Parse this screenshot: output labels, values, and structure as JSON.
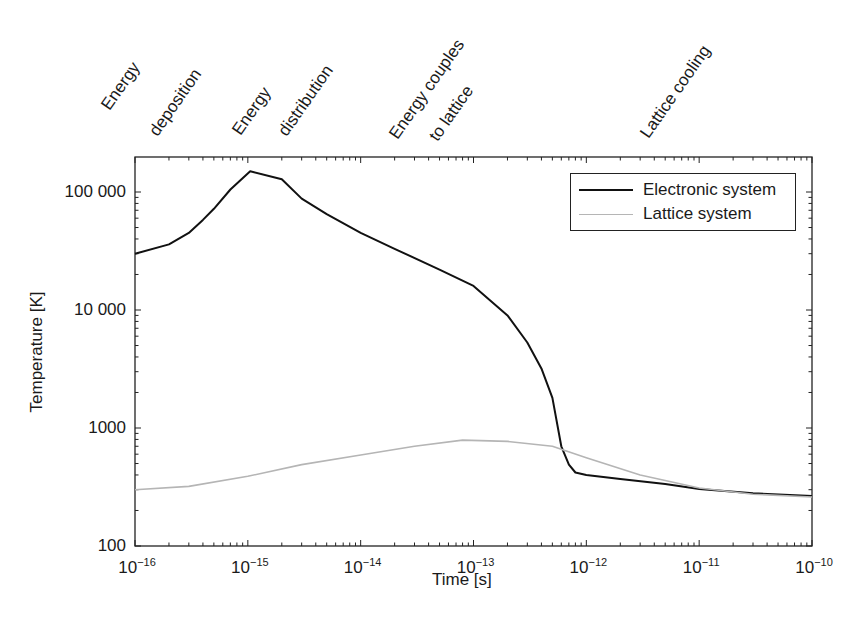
{
  "chart_data": {
    "type": "line",
    "title": "",
    "xlabel": "Time [s]",
    "ylabel": "Temperature [K]",
    "xscale": "log",
    "yscale": "log",
    "xlim": [
      1e-16,
      1e-10
    ],
    "ylim": [
      100,
      200000
    ],
    "x_tick_labels": [
      "10^-16",
      "10^-15",
      "10^-14",
      "10^-13",
      "10^-12",
      "10^-11",
      "10^-10"
    ],
    "y_tick_labels": [
      "100",
      "1000",
      "10 000",
      "100 000"
    ],
    "grid": false,
    "legend_position": "upper right",
    "phase_annotations": [
      {
        "text": "Energy",
        "x": 1e-16
      },
      {
        "text": "deposition",
        "x": 2.2e-16
      },
      {
        "text": "Energy",
        "x": 1e-15
      },
      {
        "text": "distribution",
        "x": 2.2e-15
      },
      {
        "text": "Energy couples",
        "x": 1.8e-14
      },
      {
        "text": "to lattice",
        "x": 4e-14
      },
      {
        "text": "Lattice cooling",
        "x": 3.5e-12
      }
    ],
    "series": [
      {
        "name": "Electronic system",
        "color": "#111111",
        "x": [
          1e-16,
          2e-16,
          3e-16,
          4e-16,
          5e-16,
          7e-16,
          1.05e-15,
          2e-15,
          3e-15,
          5e-15,
          1e-14,
          2e-14,
          5e-14,
          1e-13,
          2e-13,
          3e-13,
          4e-13,
          5e-13,
          6e-13,
          7e-13,
          8e-13,
          1e-12,
          2e-12,
          5e-12,
          1e-11,
          3e-11,
          1e-10
        ],
        "y": [
          30000,
          36000,
          45000,
          58000,
          72000,
          105000,
          150000,
          128000,
          88000,
          65000,
          45000,
          33000,
          22000,
          16000,
          9000,
          5300,
          3200,
          1800,
          700,
          490,
          420,
          400,
          370,
          335,
          305,
          280,
          265
        ]
      },
      {
        "name": "Lattice system",
        "color": "#b5b5b5",
        "x": [
          1e-16,
          3e-16,
          1e-15,
          3e-15,
          1e-14,
          3e-14,
          8e-14,
          2e-13,
          5e-13,
          1e-12,
          3e-12,
          1e-11,
          3e-11,
          1e-10
        ],
        "y": [
          300,
          320,
          390,
          490,
          590,
          700,
          790,
          770,
          700,
          560,
          400,
          310,
          275,
          260
        ]
      }
    ]
  },
  "legend": {
    "items": [
      {
        "label": "Electronic system",
        "color": "#111111"
      },
      {
        "label": "Lattice system",
        "color": "#b5b5b5"
      }
    ]
  },
  "axes": {
    "xlabel": "Time [s]",
    "ylabel": "Temperature [K]",
    "y_ticks": [
      {
        "label": "100 000",
        "value": 100000
      },
      {
        "label": "10 000",
        "value": 10000
      },
      {
        "label": "1000",
        "value": 1000
      },
      {
        "label": "100",
        "value": 100
      }
    ],
    "x_ticks": [
      {
        "base": "10",
        "exp": "−16",
        "value": 1e-16
      },
      {
        "base": "10",
        "exp": "−15",
        "value": 1e-15
      },
      {
        "base": "10",
        "exp": "−14",
        "value": 1e-14
      },
      {
        "base": "10",
        "exp": "−13",
        "value": 1e-13
      },
      {
        "base": "10",
        "exp": "−12",
        "value": 1e-12
      },
      {
        "base": "10",
        "exp": "−11",
        "value": 1e-11
      },
      {
        "base": "10",
        "exp": "−10",
        "value": 1e-10
      }
    ]
  },
  "phases": [
    {
      "label": "Energy",
      "left": 112,
      "top": 96
    },
    {
      "label": "deposition",
      "left": 160,
      "top": 122
    },
    {
      "label": "Energy",
      "left": 243,
      "top": 121
    },
    {
      "label": "distribution",
      "left": 289,
      "top": 122
    },
    {
      "label": "Energy couples",
      "left": 400,
      "top": 125
    },
    {
      "label": "to lattice",
      "left": 440,
      "top": 127
    },
    {
      "label": "Lattice cooling",
      "left": 651,
      "top": 124
    }
  ]
}
